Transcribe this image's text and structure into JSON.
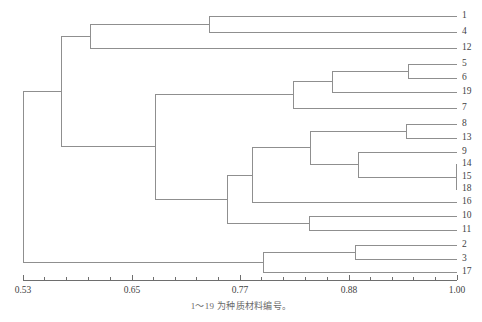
{
  "figure": {
    "caption": "1～19 为种质材料编号。",
    "line_color": "#8f8f8f",
    "axis_color": "#6e6e6e",
    "text_color": "#3f3f3f",
    "background": "#ffffff"
  },
  "chart_data": {
    "type": "dendrogram",
    "title": "",
    "xlabel": "",
    "ylabel": "",
    "xlim": [
      0.53,
      1.0
    ],
    "grid": false,
    "legend": null,
    "axis": {
      "tick_labels": [
        "0.53",
        "0.65",
        "0.77",
        "0.88",
        "1.00"
      ],
      "tick_values": [
        0.53,
        0.65,
        0.77,
        0.88,
        1.0
      ],
      "minor_ticks_per_interval": 4,
      "orientation": "bottom",
      "direction": "similarity-increasing-right"
    },
    "leaf_order": [
      "1",
      "4",
      "12",
      "5",
      "6",
      "19",
      "7",
      "8",
      "13",
      "9",
      "14",
      "15",
      "18",
      "16",
      "10",
      "11",
      "2",
      "3",
      "17"
    ],
    "leaf_count": 19,
    "leaves": [
      {
        "label": "1",
        "y": 16
      },
      {
        "label": "4",
        "y": 32
      },
      {
        "label": "12",
        "y": 48
      },
      {
        "label": "5",
        "y": 64
      },
      {
        "label": "6",
        "y": 78
      },
      {
        "label": "19",
        "y": 92
      },
      {
        "label": "7",
        "y": 108
      },
      {
        "label": "8",
        "y": 124
      },
      {
        "label": "13",
        "y": 138
      },
      {
        "label": "9",
        "y": 152
      },
      {
        "label": "14",
        "y": 164
      },
      {
        "label": "15",
        "y": 177
      },
      {
        "label": "18",
        "y": 189
      },
      {
        "label": "16",
        "y": 202
      },
      {
        "label": "10",
        "y": 216
      },
      {
        "label": "11",
        "y": 230
      },
      {
        "label": "2",
        "y": 245
      },
      {
        "label": "3",
        "y": 259
      },
      {
        "label": "17",
        "y": 272
      }
    ],
    "merges": [
      {
        "id": "m1_4",
        "members": [
          "1",
          "4"
        ],
        "similarity": 0.758,
        "x": 209,
        "y_top": 16,
        "y_bottom": 32
      },
      {
        "id": "m1_4_12",
        "members": [
          "1",
          "4",
          "12"
        ],
        "similarity": 0.607,
        "x": 90,
        "y_top": 24,
        "y_bottom": 48
      },
      {
        "id": "m5_6",
        "members": [
          "5",
          "6"
        ],
        "similarity": 0.939,
        "x": 408,
        "y_top": 64,
        "y_bottom": 78
      },
      {
        "id": "m5_6_19",
        "members": [
          "5",
          "6",
          "19"
        ],
        "similarity": 0.875,
        "x": 332,
        "y_top": 71,
        "y_bottom": 92
      },
      {
        "id": "m5_6_19_7",
        "members": [
          "5",
          "6",
          "19",
          "7"
        ],
        "similarity": 0.858,
        "x": 293,
        "y_top": 81,
        "y_bottom": 108
      },
      {
        "id": "m8_13",
        "members": [
          "8",
          "13"
        ],
        "similarity": 0.938,
        "x": 406,
        "y_top": 124,
        "y_bottom": 138
      },
      {
        "id": "m14_15_18",
        "members": [
          "14",
          "15",
          "18"
        ],
        "similarity": 0.999,
        "x": 456,
        "y_top": 164,
        "y_bottom": 189
      },
      {
        "id": "m9_141518",
        "members": [
          "9",
          "14",
          "15",
          "18"
        ],
        "similarity": 0.961,
        "x": 358,
        "y_top": 152,
        "y_bottom": 177
      },
      {
        "id": "m8_13_9grp",
        "members": [
          "8",
          "13",
          "9",
          "14",
          "15",
          "18"
        ],
        "similarity": 0.91,
        "x": 310,
        "y_top": 131,
        "y_bottom": 164
      },
      {
        "id": "m_plus16",
        "members": [
          "8",
          "13",
          "9",
          "14",
          "15",
          "18",
          "16"
        ],
        "similarity": 0.827,
        "x": 252,
        "y_top": 148,
        "y_bottom": 202
      },
      {
        "id": "m10_11",
        "members": [
          "10",
          "11"
        ],
        "similarity": 0.908,
        "x": 309,
        "y_top": 216,
        "y_bottom": 230
      },
      {
        "id": "m_plus1011",
        "members": [
          "8",
          "13",
          "9",
          "14",
          "15",
          "18",
          "16",
          "10",
          "11"
        ],
        "similarity": 0.794,
        "x": 227,
        "y_top": 175,
        "y_bottom": 223
      },
      {
        "id": "m_mid_big",
        "members": [
          "5",
          "6",
          "19",
          "7",
          "8",
          "13",
          "9",
          "14",
          "15",
          "18",
          "16",
          "10",
          "11"
        ],
        "similarity": 0.668,
        "x": 155,
        "y_top": 94,
        "y_bottom": 199
      },
      {
        "id": "m2_3",
        "members": [
          "2",
          "3"
        ],
        "similarity": 0.894,
        "x": 355,
        "y_top": 245,
        "y_bottom": 259
      },
      {
        "id": "m2_3_17",
        "members": [
          "2",
          "3",
          "17"
        ],
        "similarity": 0.793,
        "x": 263,
        "y_top": 252,
        "y_bottom": 272
      },
      {
        "id": "m_upper",
        "members": [
          "1",
          "4",
          "12",
          "5",
          "6",
          "19",
          "7",
          "8",
          "13",
          "9",
          "14",
          "15",
          "18",
          "16",
          "10",
          "11"
        ],
        "similarity": 0.574,
        "x": 61,
        "y_top": 36,
        "y_bottom": 146
      },
      {
        "id": "m_root",
        "members": [
          "all"
        ],
        "similarity": 0.53,
        "x": 23,
        "y_top": 91,
        "y_bottom": 262
      }
    ],
    "geometry": {
      "plot_left_x": 23,
      "plot_right_x": 457,
      "axis_y": 280,
      "tick_x": [
        23,
        132,
        240,
        349,
        457
      ],
      "tick_len_major": 5,
      "tick_len_minor": 3
    }
  }
}
